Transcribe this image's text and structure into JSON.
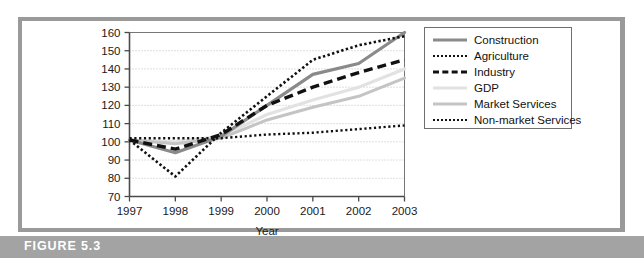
{
  "figure": {
    "caption": "FIGURE 5.3"
  },
  "legend": {
    "position": "right",
    "entries": [
      {
        "label": "Construction",
        "style": "solid",
        "color": "#8a8a8a",
        "width": 3.2
      },
      {
        "label": "Agriculture",
        "style": "dotted",
        "color": "#111111",
        "width": 2.6
      },
      {
        "label": "Industry",
        "style": "dashed",
        "color": "#111111",
        "width": 3.4
      },
      {
        "label": "GDP",
        "style": "solid",
        "color": "#e2e2e2",
        "width": 3.2
      },
      {
        "label": "Market Services",
        "style": "solid",
        "color": "#c4c4c4",
        "width": 3.0
      },
      {
        "label": "Non-market Services",
        "style": "fine-dotted",
        "color": "#111111",
        "width": 2.4
      }
    ]
  },
  "chart_data": {
    "type": "line",
    "title": "",
    "xlabel": "Year",
    "ylabel": "",
    "x": [
      1997,
      1998,
      1999,
      2000,
      2001,
      2002,
      2003
    ],
    "xticklabels": [
      "1997",
      "1998",
      "1999",
      "2000",
      "2001",
      "2002",
      "2003"
    ],
    "yticks": [
      70,
      80,
      90,
      100,
      110,
      120,
      130,
      140,
      150,
      160
    ],
    "yticklabels": [
      "70",
      "80",
      "90",
      "100",
      "110",
      "120",
      "130",
      "140",
      "150",
      "160"
    ],
    "ylim": [
      70,
      160
    ],
    "grid": true,
    "grid_style": "dotted",
    "series": [
      {
        "name": "Construction",
        "values": [
          101,
          94,
          103,
          120,
          137,
          143,
          160
        ]
      },
      {
        "name": "Agriculture",
        "values": [
          101,
          81,
          105,
          125,
          145,
          153,
          158
        ]
      },
      {
        "name": "Industry",
        "values": [
          101,
          96,
          104,
          120,
          130,
          138,
          145
        ]
      },
      {
        "name": "GDP",
        "values": [
          101,
          100,
          103,
          115,
          123,
          130,
          140
        ]
      },
      {
        "name": "Market Services",
        "values": [
          101,
          99,
          102,
          112,
          119,
          125,
          135
        ]
      },
      {
        "name": "Non-market Services",
        "values": [
          102,
          102,
          102,
          104,
          105,
          107,
          109
        ]
      }
    ]
  },
  "colors": {
    "frame": "#9a9a9a",
    "caption_bar": "#a3a3a3",
    "caption_text": "#ffffff",
    "axis": "#4a4a4a",
    "grid": "#b9b9b9"
  }
}
